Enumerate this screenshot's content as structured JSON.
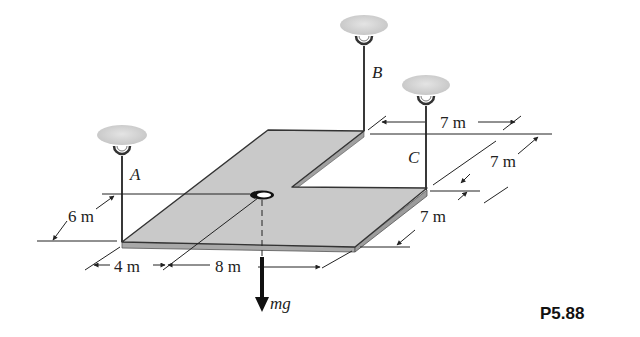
{
  "figure": {
    "problem_id": "P5.88",
    "supports": [
      {
        "label": "A"
      },
      {
        "label": "B"
      },
      {
        "label": "C"
      }
    ],
    "force_label": "mg",
    "dimensions": {
      "left_depth": "6 m",
      "front_a": "4 m",
      "front_b": "8 m",
      "top_width": "7 m",
      "right_upper": "7 m",
      "right_lower": "7 m"
    }
  },
  "colors": {
    "plate_fill": "#c9c9c9",
    "plate_edge": "#9a9a9a",
    "line": "#222222",
    "ceiling": "#d6d6d6"
  }
}
